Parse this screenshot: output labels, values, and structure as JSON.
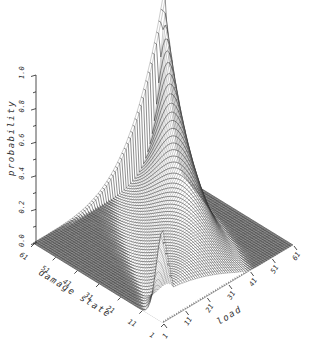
{
  "chart_data": {
    "type": "surface3d",
    "title": "",
    "zlabel": "probability",
    "xlabel": "damage state",
    "ylabel": "load",
    "z_ticks": [
      "0.0",
      "0.2",
      "0.4",
      "0.6",
      "0.8",
      "1.0"
    ],
    "z_range": [
      0,
      1
    ],
    "damage_state_ticks": [
      "1",
      "11",
      "21",
      "31",
      "41",
      "51",
      "61"
    ],
    "load_ticks": [
      "1",
      "11",
      "21",
      "31",
      "41",
      "51",
      "61"
    ],
    "damage_state_range": [
      1,
      61
    ],
    "load_range": [
      1,
      61
    ],
    "grid": false,
    "legend": null,
    "key_points": [
      {
        "load": 1,
        "damage_state": 1,
        "probability": 0.6
      },
      {
        "load": 31,
        "damage_state": 31,
        "probability": 0.15
      },
      {
        "load": 61,
        "damage_state": 61,
        "probability": 1.0
      }
    ]
  },
  "geometry": {
    "corner_left": [
      33,
      243
    ],
    "corner_bottom": [
      163,
      323
    ],
    "corner_right": [
      293,
      245
    ],
    "z_scale_px": 168
  }
}
